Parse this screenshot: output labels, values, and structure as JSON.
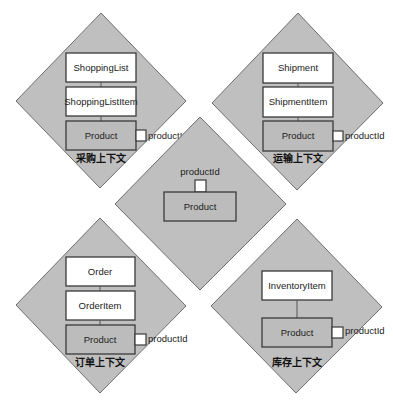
{
  "colors": {
    "background": "#ffffff",
    "diamond_fill": "#bfbfbf",
    "diamond_stroke": "#6e6e6e",
    "entity_box_fill": "#ffffff",
    "product_box_fill": "#bcbcbc",
    "box_stroke": "#3a3a3a"
  },
  "contexts": {
    "procurement": {
      "title": "采购上下文",
      "entities": [
        "ShoppingList",
        "ShoppingListItem"
      ],
      "product": "Product",
      "port_label": "productId"
    },
    "shipping": {
      "title": "运输上下文",
      "entities": [
        "Shipment",
        "ShipmentItem"
      ],
      "product": "Product",
      "port_label": "productId"
    },
    "order": {
      "title": "订单上下文",
      "entities": [
        "Order",
        "OrderItem"
      ],
      "product": "Product",
      "port_label": "productId"
    },
    "inventory": {
      "title": "库存上下文",
      "entities": [
        "InventoryItem"
      ],
      "product": "Product",
      "port_label": "productId"
    }
  },
  "shared_kernel": {
    "product": "Product",
    "port_label": "productId"
  }
}
